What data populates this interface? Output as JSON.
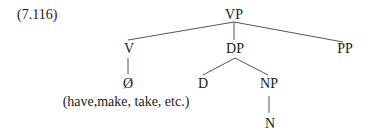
{
  "example_number": "(7.116)",
  "tree": {
    "nodes": [
      {
        "id": "VP",
        "label": "VP",
        "x": 234,
        "y": 8
      },
      {
        "id": "V",
        "label": "V",
        "x": 129,
        "y": 42
      },
      {
        "id": "DP",
        "label": "DP",
        "x": 235,
        "y": 42
      },
      {
        "id": "PP",
        "label": "PP",
        "x": 345,
        "y": 42
      },
      {
        "id": "null",
        "label": "Ø",
        "x": 128,
        "y": 77
      },
      {
        "id": "D",
        "label": "D",
        "x": 203,
        "y": 77
      },
      {
        "id": "NP",
        "label": "NP",
        "x": 269,
        "y": 77
      },
      {
        "id": "N",
        "label": "N",
        "x": 270,
        "y": 117
      }
    ],
    "annotation": "(have,make, take, etc.)",
    "edges": [
      [
        "VP",
        "V"
      ],
      [
        "VP",
        "DP"
      ],
      [
        "VP",
        "PP"
      ],
      [
        "V",
        "null"
      ],
      [
        "DP",
        "D"
      ],
      [
        "DP",
        "NP"
      ],
      [
        "NP",
        "N"
      ]
    ]
  },
  "colors": {
    "line": "#555555",
    "text": "#1a1a1a",
    "background": "#ffffff"
  }
}
